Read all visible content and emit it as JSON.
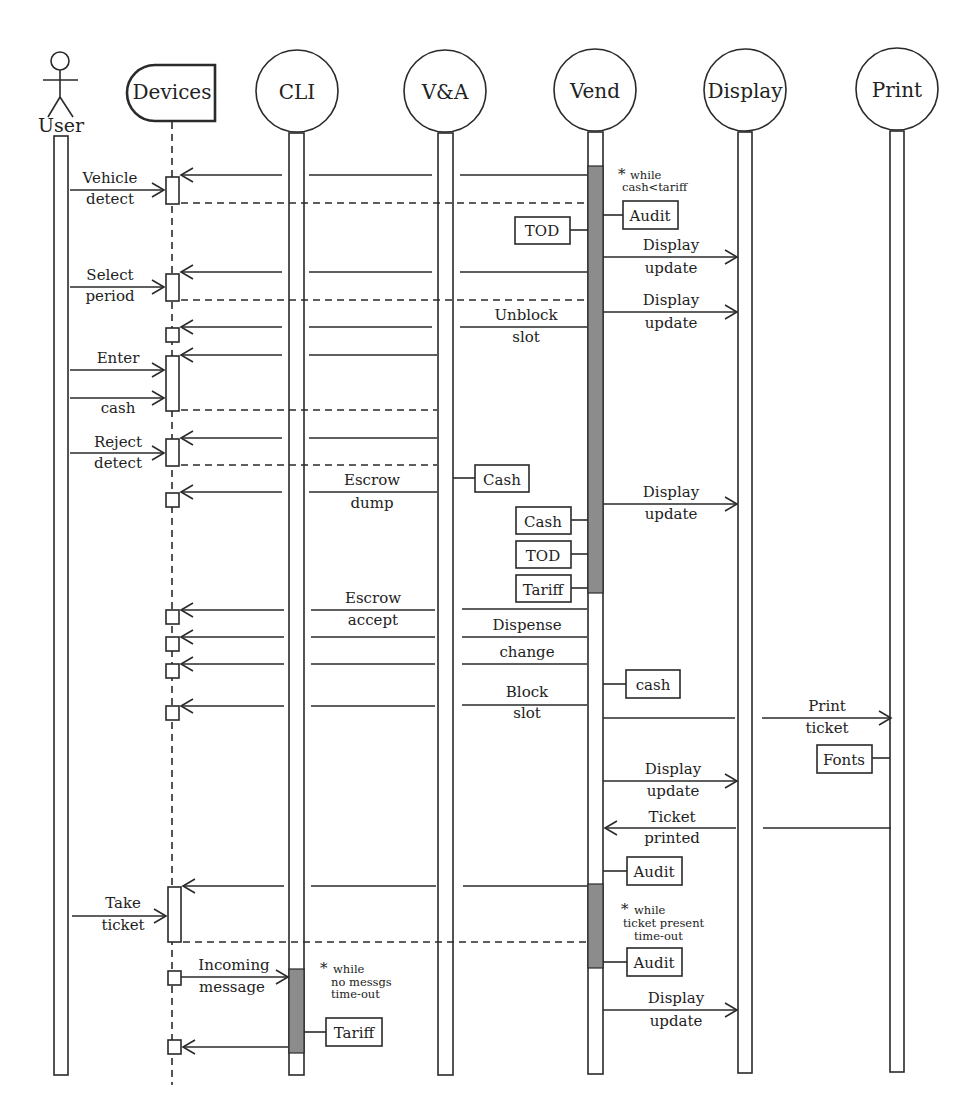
{
  "diagram": {
    "type": "sequence-diagram",
    "participants": [
      {
        "id": "user",
        "label": "User",
        "kind": "actor",
        "x": 61
      },
      {
        "id": "devices",
        "label": "Devices",
        "kind": "device",
        "x": 172
      },
      {
        "id": "cli",
        "label": "CLI",
        "kind": "task",
        "x": 297
      },
      {
        "id": "va",
        "label": "V&A",
        "kind": "task",
        "x": 445
      },
      {
        "id": "vend",
        "label": "Vend",
        "kind": "task",
        "x": 595
      },
      {
        "id": "display",
        "label": "Display",
        "kind": "task",
        "x": 745
      },
      {
        "id": "print",
        "label": "Print",
        "kind": "task",
        "x": 897
      }
    ],
    "messages": [
      {
        "id": "vehicle-detect",
        "label": [
          "Vehicle",
          "detect"
        ],
        "from": "user",
        "to": "devices"
      },
      {
        "id": "select-period",
        "label": [
          "Select",
          "period"
        ],
        "from": "user",
        "to": "devices"
      },
      {
        "id": "enter-cash",
        "label": [
          "Enter",
          "cash"
        ],
        "from": "user",
        "to": "devices"
      },
      {
        "id": "reject-detect",
        "label": [
          "Reject",
          "detect"
        ],
        "from": "user",
        "to": "devices"
      },
      {
        "id": "escrow-dump",
        "label": [
          "Escrow",
          "dump"
        ],
        "from": "va",
        "to": "devices"
      },
      {
        "id": "unblock-slot",
        "label": [
          "Unblock",
          "slot"
        ],
        "from": "vend",
        "to": "devices"
      },
      {
        "id": "display-update-1",
        "label": [
          "Display",
          "update"
        ],
        "from": "vend",
        "to": "display"
      },
      {
        "id": "display-update-2",
        "label": [
          "Display",
          "update"
        ],
        "from": "vend",
        "to": "display"
      },
      {
        "id": "display-update-3",
        "label": [
          "Display",
          "update"
        ],
        "from": "vend",
        "to": "display"
      },
      {
        "id": "escrow-accept",
        "label": [
          "Escrow",
          "accept"
        ],
        "from": "vend",
        "to": "devices"
      },
      {
        "id": "dispense-change",
        "label": [
          "Dispense",
          "change"
        ],
        "from": "vend",
        "to": "devices"
      },
      {
        "id": "block-slot",
        "label": [
          "Block",
          "slot"
        ],
        "from": "vend",
        "to": "devices"
      },
      {
        "id": "print-ticket",
        "label": [
          "Print",
          "ticket"
        ],
        "from": "vend",
        "to": "print"
      },
      {
        "id": "display-update-4",
        "label": [
          "Display",
          "update"
        ],
        "from": "vend",
        "to": "display"
      },
      {
        "id": "ticket-printed",
        "label": [
          "Ticket",
          "printed"
        ],
        "from": "print",
        "to": "vend"
      },
      {
        "id": "take-ticket",
        "label": [
          "Take",
          "ticket"
        ],
        "from": "user",
        "to": "devices"
      },
      {
        "id": "incoming-message",
        "label": [
          "Incoming",
          "message"
        ],
        "from": "devices",
        "to": "cli"
      },
      {
        "id": "display-update-5",
        "label": [
          "Display",
          "update"
        ],
        "from": "vend",
        "to": "display"
      }
    ],
    "data_stores": [
      {
        "id": "audit-1",
        "label": "Audit",
        "owner": "vend"
      },
      {
        "id": "tod-1",
        "label": "TOD",
        "owner": "vend"
      },
      {
        "id": "cash-va",
        "label": "Cash",
        "owner": "va"
      },
      {
        "id": "cash-vend",
        "label": "Cash",
        "owner": "vend"
      },
      {
        "id": "tod-2",
        "label": "TOD",
        "owner": "vend"
      },
      {
        "id": "tariff-vend",
        "label": "Tariff",
        "owner": "vend"
      },
      {
        "id": "cash-lower",
        "label": "cash",
        "owner": "vend"
      },
      {
        "id": "fonts",
        "label": "Fonts",
        "owner": "print"
      },
      {
        "id": "audit-2",
        "label": "Audit",
        "owner": "vend"
      },
      {
        "id": "audit-3",
        "label": "Audit",
        "owner": "vend"
      },
      {
        "id": "tariff-cli",
        "label": "Tariff",
        "owner": "cli"
      }
    ],
    "loops": [
      {
        "id": "loop-cash",
        "marker": "*",
        "lines": [
          "while",
          "cash<tariff"
        ]
      },
      {
        "id": "loop-ticket",
        "marker": "*",
        "lines": [
          "while",
          "ticket present",
          "time-out"
        ]
      },
      {
        "id": "loop-messages",
        "marker": "*",
        "lines": [
          "while",
          "no messgs",
          "time-out"
        ]
      }
    ]
  }
}
